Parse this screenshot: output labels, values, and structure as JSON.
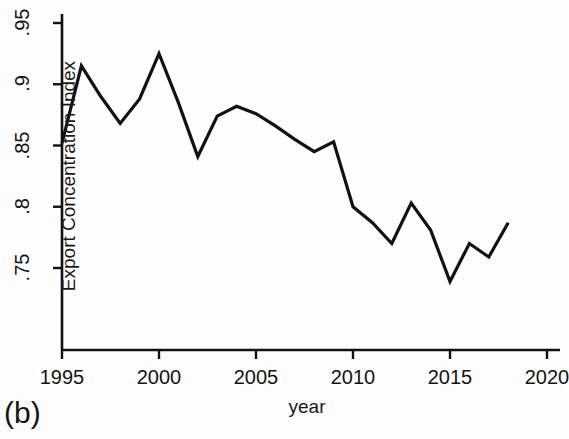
{
  "figure": {
    "panel_caption": "(b)",
    "background_color": "#fdfdfd",
    "line_color": "#111111"
  },
  "chart_data": {
    "type": "line",
    "title": "",
    "subtitle": "",
    "xlabel": "year",
    "ylabel": "Export Concentration Index",
    "xlim": [
      1995,
      2020
    ],
    "ylim": [
      0.7265,
      0.9535
    ],
    "xticks": [
      1995,
      2000,
      2005,
      2010,
      2015,
      2020
    ],
    "xtick_labels": [
      "1995",
      "2000",
      "2005",
      "2010",
      "2015",
      "2020"
    ],
    "yticks": [
      0.75,
      0.8,
      0.85,
      0.9,
      0.95
    ],
    "ytick_labels": [
      ".75",
      ".8",
      ".85",
      ".9",
      ".95"
    ],
    "grid": false,
    "legend": null,
    "legend_position": "none",
    "x": [
      1995,
      1996,
      1997,
      1998,
      1999,
      2000,
      2001,
      2002,
      2003,
      2004,
      2005,
      2006,
      2007,
      2008,
      2009,
      2010,
      2011,
      2012,
      2013,
      2014,
      2015,
      2016,
      2017,
      2018
    ],
    "values": [
      0.852,
      0.915,
      0.89,
      0.868,
      0.888,
      0.925,
      0.885,
      0.841,
      0.874,
      0.882,
      0.876,
      0.866,
      0.855,
      0.845,
      0.853,
      0.8,
      0.787,
      0.77,
      0.803,
      0.781,
      0.739,
      0.77,
      0.759,
      0.787
    ],
    "series": [
      {
        "name": "Export Concentration Index",
        "values": [
          0.852,
          0.915,
          0.89,
          0.868,
          0.888,
          0.925,
          0.885,
          0.841,
          0.874,
          0.882,
          0.876,
          0.866,
          0.855,
          0.845,
          0.853,
          0.8,
          0.787,
          0.77,
          0.803,
          0.781,
          0.739,
          0.77,
          0.759,
          0.787
        ]
      }
    ]
  }
}
